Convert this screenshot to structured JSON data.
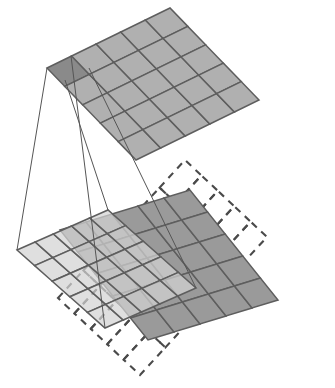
{
  "figure": {
    "title": "Convolution receptive-field projection diagram",
    "projection": "isometric-parallelogram",
    "background_color": "#ffffff"
  },
  "colors": {
    "output_map_fill": "#b0b0b0",
    "output_map_highlight_fill": "#8a8a8a",
    "kernel_patch_fill": "#d2d2d2",
    "input_map_fill": "#9a9a9a",
    "overlap_fill": "#828282",
    "grid_stroke": "#5e5e5e",
    "padding_dash_stroke": "#4a4a4a",
    "connector_stroke": "#555555"
  },
  "layers": [
    {
      "name": "output-feature-map",
      "role": "upper plane / output activation grid",
      "rows": 5,
      "cols": 5,
      "cell_count": 25,
      "fill": "#b0b0b0",
      "highlighted_cells": [
        {
          "row": 0,
          "col": 0,
          "fill": "#8a8a8a"
        }
      ],
      "corners": {
        "left": {
          "x": 47,
          "y": 68
        },
        "top": {
          "x": 170,
          "y": 8
        },
        "right": {
          "x": 265,
          "y": 97
        },
        "bottom": {
          "x": 136,
          "y": 160
        }
      }
    },
    {
      "name": "kernel-receptive-patch",
      "role": "lower plane / 5x5 receptive field patch",
      "rows": 5,
      "cols": 5,
      "cell_count": 25,
      "fill": "#d2d2d2",
      "corners": {
        "left": {
          "x": 17,
          "y": 250
        },
        "top": {
          "x": 108,
          "y": 210
        },
        "right": {
          "x": 196,
          "y": 288
        },
        "bottom": {
          "x": 105,
          "y": 328
        }
      }
    },
    {
      "name": "input-feature-map",
      "role": "lower plane / input activation grid",
      "rows": 5,
      "cols": 5,
      "cell_count": 25,
      "fill": "#9a9a9a",
      "corners": {
        "left": {
          "x": 60,
          "y": 230
        },
        "top": {
          "x": 190,
          "y": 190
        },
        "right": {
          "x": 278,
          "y": 280
        },
        "bottom": {
          "x": 148,
          "y": 340
        }
      }
    },
    {
      "name": "padding-outline",
      "role": "lower plane / zero-padding boundary (dashed)",
      "rows": 5,
      "cols": 5,
      "cell_count": 25,
      "stroke_style": "dashed",
      "stroke": "#4a4a4a",
      "corners": {
        "left": {
          "x": 58,
          "y": 298
        },
        "top": {
          "x": 185,
          "y": 160
        },
        "right": {
          "x": 320,
          "y": 310
        },
        "bottom": {
          "x": 140,
          "y": 375
        }
      }
    }
  ],
  "connectors": {
    "name": "receptive-field-connectors",
    "count": 4,
    "stroke": "#555555",
    "description": "four thin lines joining the corners of the highlighted output cell to the corners of the 5x5 receptive patch",
    "lines": [
      {
        "from": {
          "x": 47,
          "y": 68
        },
        "to": {
          "x": 17,
          "y": 250
        }
      },
      {
        "from": {
          "x": 71,
          "y": 56
        },
        "to": {
          "x": 105,
          "y": 328
        }
      },
      {
        "from": {
          "x": 65,
          "y": 80
        },
        "to": {
          "x": 108,
          "y": 210
        }
      },
      {
        "from": {
          "x": 89,
          "y": 68
        },
        "to": {
          "x": 196,
          "y": 288
        }
      }
    ]
  },
  "labels": {
    "none_visible": "",
    "text_items": []
  }
}
